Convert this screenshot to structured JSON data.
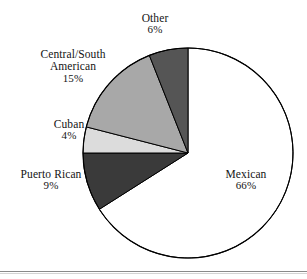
{
  "chart_data": {
    "type": "pie",
    "title": "",
    "subtitle": "",
    "xlabel": "",
    "ylabel": "",
    "legend_position": "none",
    "grid": false,
    "start_angle_deg": 0,
    "direction": "clockwise",
    "categories": [
      "Mexican",
      "Puerto Rican",
      "Cuban",
      "Central/South American",
      "Other"
    ],
    "values": [
      66,
      9,
      4,
      15,
      6
    ],
    "value_unit": "%",
    "slices": [
      {
        "label": "Mexican",
        "label_line1": "Mexican",
        "label_line2": "",
        "value": 66,
        "value_text": "66%",
        "color": "#ffffff",
        "stroke": "#000000"
      },
      {
        "label": "Puerto Rican",
        "label_line1": "Puerto Rican",
        "label_line2": "",
        "value": 9,
        "value_text": "9%",
        "color": "#3a3a3a",
        "stroke": "#000000"
      },
      {
        "label": "Cuban",
        "label_line1": "Cuban",
        "label_line2": "",
        "value": 4,
        "value_text": "4%",
        "color": "#dcdcdc",
        "stroke": "#000000"
      },
      {
        "label": "Central/South American",
        "label_line1": "Central/South",
        "label_line2": "American",
        "value": 15,
        "value_text": "15%",
        "color": "#a8a8a8",
        "stroke": "#000000"
      },
      {
        "label": "Other",
        "label_line1": "Other",
        "label_line2": "",
        "value": 6,
        "value_text": "6%",
        "color": "#555555",
        "stroke": "#000000"
      }
    ],
    "geometry": {
      "center_x": 188,
      "center_y": 153,
      "radius": 105
    },
    "colors": {
      "outline": "#000000",
      "background": "#ffffff",
      "text": "#141414",
      "rule": "#8a8a8a"
    }
  },
  "footer": {
    "rule_visible": true
  }
}
